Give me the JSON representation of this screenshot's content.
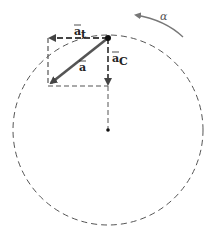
{
  "diagram": {
    "labels": {
      "a_t": "a",
      "a_t_sub": "t",
      "a": "a",
      "a_c": "a",
      "a_c_sub": "C",
      "alpha": "α"
    },
    "colors": {
      "vector": "#555555",
      "dashed": "#444444",
      "point": "#111111"
    }
  }
}
